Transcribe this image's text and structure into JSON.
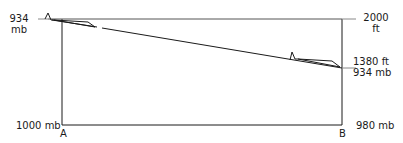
{
  "diagram": {
    "left_top_label": {
      "value": "934",
      "unit": "mb"
    },
    "right_top_label": {
      "value": "2000",
      "unit": "ft"
    },
    "right_mid_label": {
      "line1": "1380 ft",
      "line2": "934 mb"
    },
    "bottom_left_label": "1000 mb",
    "bottom_right_label": "980 mb",
    "point_a": "A",
    "point_b": "B",
    "line_color": "#1a1a1a"
  }
}
